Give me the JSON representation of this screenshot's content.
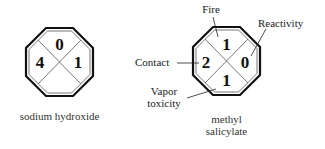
{
  "diagrams": [
    {
      "name": "sodium hydroxide",
      "caption_lines": [
        "sodium hydroxide"
      ],
      "ratings": {
        "fire": "0",
        "contact": "4",
        "reactivity": "1",
        "vapor_toxicity": ""
      }
    },
    {
      "name": "methyl salicylate",
      "caption_lines": [
        "methyl",
        "salicylate"
      ],
      "ratings": {
        "fire": "1",
        "contact": "2",
        "reactivity": "0",
        "vapor_toxicity": "1"
      },
      "callouts": {
        "fire": "Fire",
        "reactivity": "Reactivity",
        "contact": "Contact",
        "vapor_toxicity_lines": [
          "Vapor",
          "toxicity"
        ]
      }
    }
  ]
}
